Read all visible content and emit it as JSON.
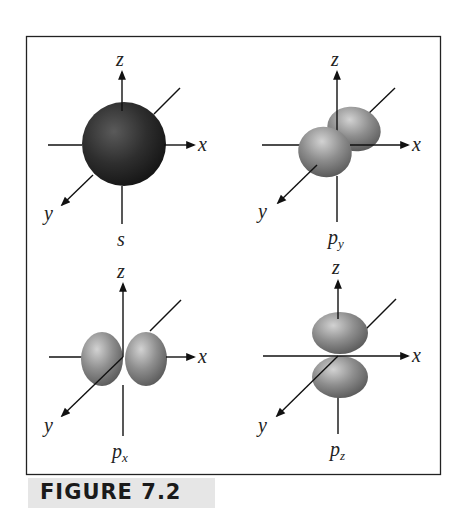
{
  "figure": {
    "caption": "FIGURE 7.2",
    "panels": [
      {
        "id": "s",
        "label": "s",
        "subscript": "",
        "axes": {
          "x": "x",
          "y": "y",
          "z": "z"
        },
        "shape": "sphere",
        "color": "#2a2a2a"
      },
      {
        "id": "py",
        "label": "p",
        "subscript": "y",
        "axes": {
          "x": "x",
          "y": "y",
          "z": "z"
        },
        "shape": "two lobes along y axis",
        "color": "#8a8a8a"
      },
      {
        "id": "px",
        "label": "p",
        "subscript": "x",
        "axes": {
          "x": "x",
          "y": "y",
          "z": "z"
        },
        "shape": "two lobes along x axis",
        "color": "#8a8a8a"
      },
      {
        "id": "pz",
        "label": "p",
        "subscript": "z",
        "axes": {
          "x": "x",
          "y": "y",
          "z": "z"
        },
        "shape": "two lobes along z axis",
        "color": "#8a8a8a"
      }
    ]
  }
}
